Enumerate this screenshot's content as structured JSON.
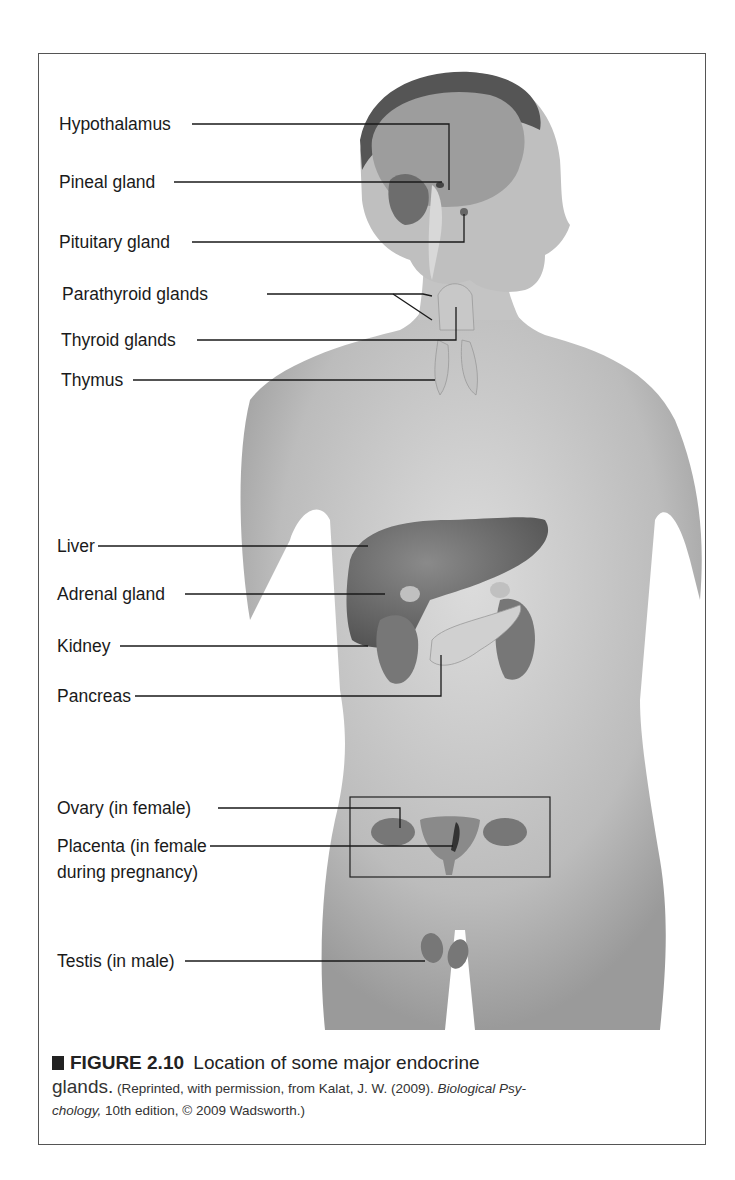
{
  "figure": {
    "labels": {
      "hypothalamus": "Hypothalamus",
      "pineal": "Pineal gland",
      "pituitary": "Pituitary gland",
      "parathyroid": "Parathyroid glands",
      "thyroid": "Thyroid glands",
      "thymus": "Thymus",
      "liver": "Liver",
      "adrenal": "Adrenal gland",
      "kidney": "Kidney",
      "pancreas": "Pancreas",
      "ovary": "Ovary (in female)",
      "placenta_line1": "Placenta (in female",
      "placenta_line2": "during pregnancy)",
      "testis": "Testis (in male)"
    },
    "caption": {
      "figure_number": "FIGURE 2.10",
      "title_part1": "Location of some major endocrine",
      "title_part2": "glands.",
      "credit_prefix": "(Reprinted, with permission, from Kalat, J. W. (2009).",
      "credit_book_part1": "Biological Psy-",
      "credit_book_part2": "chology,",
      "credit_suffix": "10th edition, © 2009 Wadsworth.)"
    },
    "colors": {
      "skin": "#c9c9c9",
      "organ": "#6e6e6e",
      "gland_light": "#bdbdbd",
      "leader_line": "#1a1a1a"
    }
  }
}
